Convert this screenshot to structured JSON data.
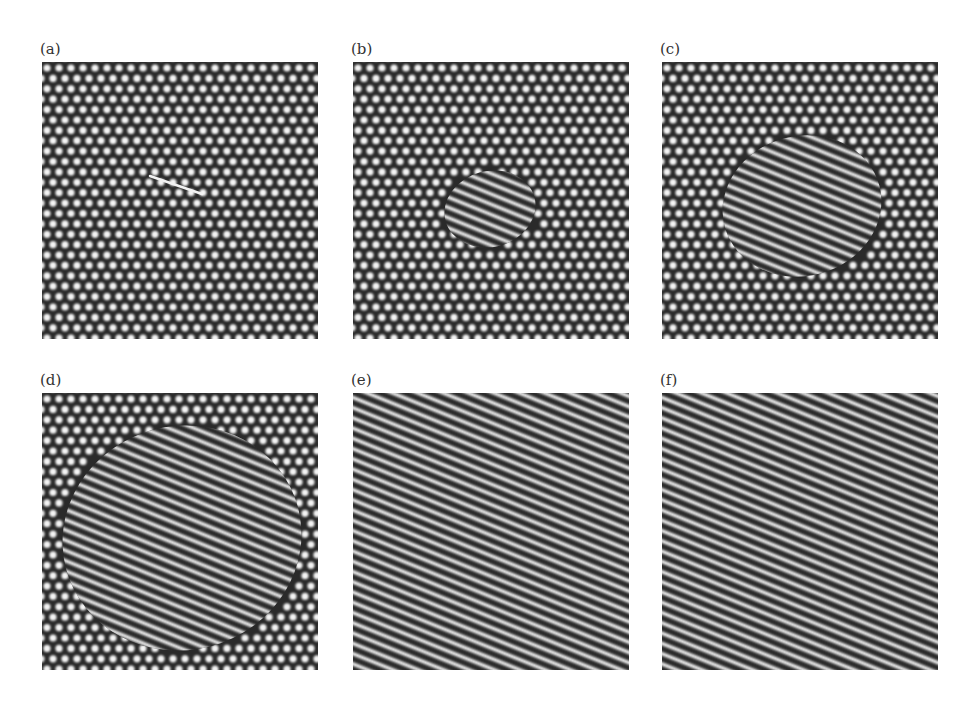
{
  "figure": {
    "panels": [
      {
        "id": "a",
        "label": "(a)",
        "description": "Hexagonal spot lattice with a short stripe nucleus (line defect) near center",
        "stripe_domain": {
          "shape": "line",
          "cx": 123,
          "cy": 123,
          "rx": 32,
          "ry": 2
        }
      },
      {
        "id": "b",
        "label": "(b)",
        "description": "Small stripe domain grown in center of hexagonal lattice",
        "stripe_domain": {
          "shape": "ellipse",
          "cx": 137,
          "cy": 147,
          "rx": 46,
          "ry": 38
        }
      },
      {
        "id": "c",
        "label": "(c)",
        "description": "Larger stripe domain expanding within hexagonal lattice",
        "stripe_domain": {
          "shape": "ellipse",
          "cx": 140,
          "cy": 144,
          "rx": 80,
          "ry": 70
        }
      },
      {
        "id": "d",
        "label": "(d)",
        "description": "Stripe domain occupies most of the panel, hexagonal spots at edges",
        "stripe_domain": {
          "shape": "ellipse",
          "cx": 140,
          "cy": 145,
          "rx": 120,
          "ry": 112
        }
      },
      {
        "id": "e",
        "label": "(e)",
        "description": "Nearly complete stripe pattern, residual spots at four corners",
        "stripe_domain": {
          "shape": "full-with-corners"
        }
      },
      {
        "id": "f",
        "label": "(f)",
        "description": "Complete oblique stripe pattern",
        "stripe_domain": {
          "shape": "full"
        }
      }
    ],
    "pattern": {
      "background_color": "#2a2a2a",
      "spot_color": "#f4f4f4",
      "stripe_color": "#f2f2f2",
      "spot_spacing_px": 12,
      "stripe_period_px": 9.5,
      "stripe_angle_deg": 22
    }
  }
}
